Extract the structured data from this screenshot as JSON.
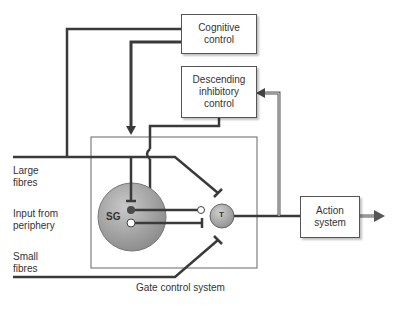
{
  "diagram": {
    "boxes": {
      "cognitive": "Cognitive control",
      "descending_line1": "Descending",
      "descending_line2": "inhibitory",
      "descending_line3": "control",
      "cognitive_line1": "Cognitive",
      "cognitive_line2": "control",
      "action_line1": "Action",
      "action_line2": "system",
      "gate": "Gate control system"
    },
    "inputs": {
      "large_line1": "Large",
      "large_line2": "fibres",
      "periphery_line1": "Input from",
      "periphery_line2": "periphery",
      "small_line1": "Small",
      "small_line2": "fibres"
    },
    "nodes": {
      "sg": "SG",
      "t": "T"
    },
    "colors": {
      "line": "#3a3a3a",
      "box_border": "#555555",
      "sg_fill": "#9a9a9a",
      "t_fill": "#a0a0a0"
    }
  }
}
